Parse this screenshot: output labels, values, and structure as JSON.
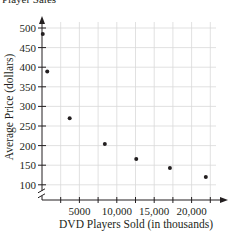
{
  "chart_data": {
    "type": "scatter",
    "title": "Player Sales",
    "xlabel": "DVD Players Sold (in thousands)",
    "ylabel": "Average Price (dollars)",
    "x_ticks": [
      "5000",
      "10,000",
      "15,000",
      "20,000"
    ],
    "y_ticks": [
      "100",
      "150",
      "200",
      "250",
      "300",
      "350",
      "400",
      "450",
      "500"
    ],
    "xlim": [
      0,
      24000
    ],
    "ylim": [
      100,
      520
    ],
    "y_axis_break": true,
    "grid": true,
    "points": [
      {
        "x": 100,
        "y": 485
      },
      {
        "x": 700,
        "y": 389
      },
      {
        "x": 3700,
        "y": 270
      },
      {
        "x": 8400,
        "y": 204
      },
      {
        "x": 12600,
        "y": 166
      },
      {
        "x": 17100,
        "y": 143
      },
      {
        "x": 21900,
        "y": 120
      }
    ]
  }
}
